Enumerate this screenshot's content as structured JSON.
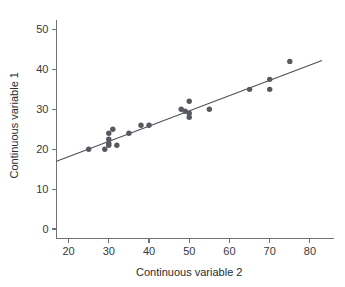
{
  "chart_data": {
    "type": "scatter",
    "title": "",
    "xlabel": "Continuous variable 2",
    "ylabel": "Continuous variable 1",
    "xlim": [
      17,
      83
    ],
    "ylim": [
      0,
      52
    ],
    "xticks": [
      20,
      30,
      40,
      50,
      60,
      70,
      80
    ],
    "xticklabels": [
      "20",
      "30",
      "40",
      "50",
      "60",
      "70",
      "80"
    ],
    "yticks": [
      0,
      10,
      20,
      30,
      40,
      50
    ],
    "yticklabels": [
      "0",
      "10",
      "20",
      "30",
      "40",
      "50"
    ],
    "grid": false,
    "legend": null,
    "marker_color": "#565a60",
    "line_color": "#4d5154",
    "axis_color": "#6e7377",
    "points": [
      {
        "x": 25,
        "y": 20
      },
      {
        "x": 29,
        "y": 20
      },
      {
        "x": 30,
        "y": 24
      },
      {
        "x": 30,
        "y": 22.5
      },
      {
        "x": 30,
        "y": 21.5
      },
      {
        "x": 30,
        "y": 21
      },
      {
        "x": 31,
        "y": 25
      },
      {
        "x": 32,
        "y": 21
      },
      {
        "x": 35,
        "y": 24
      },
      {
        "x": 38,
        "y": 26
      },
      {
        "x": 40,
        "y": 26
      },
      {
        "x": 48,
        "y": 30
      },
      {
        "x": 49,
        "y": 29.5
      },
      {
        "x": 50,
        "y": 32
      },
      {
        "x": 50,
        "y": 29
      },
      {
        "x": 50,
        "y": 28
      },
      {
        "x": 55,
        "y": 30
      },
      {
        "x": 65,
        "y": 35
      },
      {
        "x": 70,
        "y": 37.5
      },
      {
        "x": 70,
        "y": 35
      },
      {
        "x": 75,
        "y": 42
      }
    ],
    "fit_line": {
      "x_start": 17,
      "y_start": 17,
      "x_end": 83,
      "y_end": 42.2
    }
  }
}
